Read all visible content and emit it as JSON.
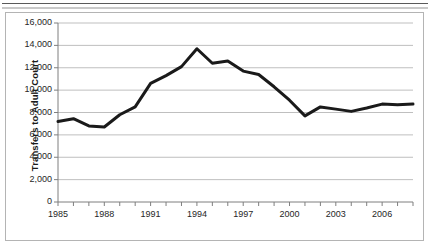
{
  "figure": {
    "caption_rule": "",
    "axis_title_y": "Transfers to Adult Court"
  },
  "chart_data": {
    "type": "line",
    "title": "",
    "subtitle": "",
    "xlabel": "",
    "ylabel": "Transfers to Adult Court",
    "xlim": [
      1985,
      2008
    ],
    "ylim": [
      0,
      16000
    ],
    "grid": true,
    "grid_axis": "y",
    "legend": false,
    "legend_position": "none",
    "line_color": "#1a1a1a",
    "line_width": 3,
    "markers": false,
    "y_ticks": [
      0,
      2000,
      4000,
      6000,
      8000,
      10000,
      12000,
      14000,
      16000
    ],
    "y_tick_labels": [
      "0",
      "2,000",
      "4,000",
      "6,000",
      "8,000",
      "10,000",
      "12,000",
      "14,000",
      "16,000"
    ],
    "x_ticks": [
      1985,
      1986,
      1987,
      1988,
      1989,
      1990,
      1991,
      1992,
      1993,
      1994,
      1995,
      1996,
      1997,
      1998,
      1999,
      2000,
      2001,
      2002,
      2003,
      2004,
      2005,
      2006,
      2007,
      2008
    ],
    "x_tick_labels_shown": [
      "1985",
      "1988",
      "1991",
      "1994",
      "1997",
      "2000",
      "2003",
      "2006"
    ],
    "x_tick_labels_shown_values": [
      1985,
      1988,
      1991,
      1994,
      1997,
      2000,
      2003,
      2006
    ],
    "x": [
      1985,
      1986,
      1987,
      1988,
      1989,
      1990,
      1991,
      1992,
      1993,
      1994,
      1995,
      1996,
      1997,
      1998,
      1999,
      2000,
      2001,
      2002,
      2003,
      2004,
      2005,
      2006,
      2007,
      2008
    ],
    "series": [
      {
        "name": "Transfers to Adult Court",
        "values": [
          7200,
          7450,
          6800,
          6700,
          7800,
          8500,
          10600,
          11300,
          12100,
          13700,
          12400,
          12600,
          11700,
          11400,
          10300,
          9100,
          7700,
          8500,
          8300,
          8100,
          8400,
          8750,
          8700,
          8750
        ]
      }
    ]
  }
}
